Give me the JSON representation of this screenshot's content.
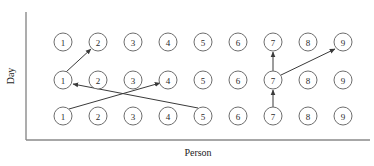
{
  "figure": {
    "background_color": "#ffffff",
    "node_stroke_color": "#6e6e6e",
    "axis_color": "#8a8a8a",
    "arrow_color": "#3a3a3a",
    "text_color": "#1c1c1c"
  },
  "axes": {
    "y_label": "Day",
    "x_label": "Person",
    "y_axis": {
      "x": 26,
      "y_top": 12,
      "y_bottom": 140
    },
    "x_axis": {
      "y": 140,
      "x_left": 26,
      "x_right": 370
    }
  },
  "chart_data": {
    "type": "diagram",
    "title": "",
    "xlabel": "Person",
    "ylabel": "Day",
    "grid": false,
    "legend": "none",
    "node_radius": 9,
    "columns_x": [
      63,
      98,
      133,
      168,
      203,
      238,
      273,
      308,
      343
    ],
    "rows_y": [
      42,
      80,
      116
    ],
    "row_names": [
      "top",
      "middle",
      "bottom"
    ],
    "column_labels": [
      "1",
      "2",
      "3",
      "4",
      "5",
      "6",
      "7",
      "8",
      "9"
    ],
    "nodes": [
      {
        "row": 0,
        "col": 0,
        "label": "1",
        "cx": 63,
        "cy": 42
      },
      {
        "row": 0,
        "col": 1,
        "label": "2",
        "cx": 98,
        "cy": 42
      },
      {
        "row": 0,
        "col": 2,
        "label": "3",
        "cx": 133,
        "cy": 42
      },
      {
        "row": 0,
        "col": 3,
        "label": "4",
        "cx": 168,
        "cy": 42
      },
      {
        "row": 0,
        "col": 4,
        "label": "5",
        "cx": 203,
        "cy": 42
      },
      {
        "row": 0,
        "col": 5,
        "label": "6",
        "cx": 238,
        "cy": 42
      },
      {
        "row": 0,
        "col": 6,
        "label": "7",
        "cx": 273,
        "cy": 42
      },
      {
        "row": 0,
        "col": 7,
        "label": "8",
        "cx": 308,
        "cy": 42
      },
      {
        "row": 0,
        "col": 8,
        "label": "9",
        "cx": 343,
        "cy": 42
      },
      {
        "row": 1,
        "col": 0,
        "label": "1",
        "cx": 63,
        "cy": 80
      },
      {
        "row": 1,
        "col": 1,
        "label": "2",
        "cx": 98,
        "cy": 80
      },
      {
        "row": 1,
        "col": 2,
        "label": "3",
        "cx": 133,
        "cy": 80
      },
      {
        "row": 1,
        "col": 3,
        "label": "4",
        "cx": 168,
        "cy": 80
      },
      {
        "row": 1,
        "col": 4,
        "label": "5",
        "cx": 203,
        "cy": 80
      },
      {
        "row": 1,
        "col": 5,
        "label": "6",
        "cx": 238,
        "cy": 80
      },
      {
        "row": 1,
        "col": 6,
        "label": "7",
        "cx": 273,
        "cy": 80
      },
      {
        "row": 1,
        "col": 7,
        "label": "8",
        "cx": 308,
        "cy": 80
      },
      {
        "row": 1,
        "col": 8,
        "label": "9",
        "cx": 343,
        "cy": 80
      },
      {
        "row": 2,
        "col": 0,
        "label": "1",
        "cx": 63,
        "cy": 116
      },
      {
        "row": 2,
        "col": 1,
        "label": "2",
        "cx": 98,
        "cy": 116
      },
      {
        "row": 2,
        "col": 2,
        "label": "3",
        "cx": 133,
        "cy": 116
      },
      {
        "row": 2,
        "col": 3,
        "label": "4",
        "cx": 168,
        "cy": 116
      },
      {
        "row": 2,
        "col": 4,
        "label": "5",
        "cx": 203,
        "cy": 116
      },
      {
        "row": 2,
        "col": 5,
        "label": "6",
        "cx": 238,
        "cy": 116
      },
      {
        "row": 2,
        "col": 6,
        "label": "7",
        "cx": 273,
        "cy": 116
      },
      {
        "row": 2,
        "col": 7,
        "label": "8",
        "cx": 308,
        "cy": 116
      },
      {
        "row": 2,
        "col": 8,
        "label": "9",
        "cx": 343,
        "cy": 116
      }
    ],
    "arrows": [
      {
        "name": "arrow-mid1-to-top2",
        "from_label": "1",
        "to_label": "2",
        "x1": 66,
        "y1": 72,
        "x2": 91,
        "y2": 49
      },
      {
        "name": "arrow-bot1-to-mid4",
        "from_label": "1",
        "to_label": "4",
        "x1": 69,
        "y1": 109,
        "x2": 160,
        "y2": 83
      },
      {
        "name": "arrow-bot5-to-mid1",
        "from_label": "5",
        "to_label": "1",
        "x1": 198,
        "y1": 108,
        "x2": 73,
        "y2": 84
      },
      {
        "name": "arrow-bot7-to-mid7",
        "from_label": "7",
        "to_label": "7",
        "x1": 273,
        "y1": 107,
        "x2": 273,
        "y2": 90
      },
      {
        "name": "arrow-mid7-to-top7",
        "from_label": "7",
        "to_label": "7",
        "x1": 273,
        "y1": 71,
        "x2": 273,
        "y2": 52
      },
      {
        "name": "arrow-mid7-to-top9",
        "from_label": "7",
        "to_label": "9",
        "x1": 281,
        "y1": 75,
        "x2": 335,
        "y2": 49
      }
    ]
  }
}
